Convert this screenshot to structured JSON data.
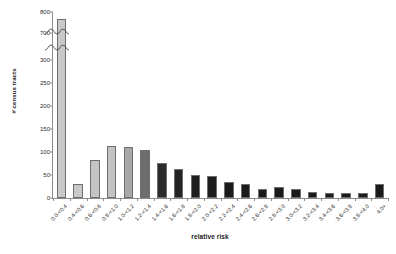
{
  "chart_data": {
    "type": "bar",
    "title": "",
    "subtitle": "",
    "xlabel": "relative risk",
    "ylabel": "# census tracts",
    "grid": false,
    "legend": null,
    "axis_break": {
      "present": true,
      "lower_range": [
        0,
        300
      ],
      "upper_range": [
        700,
        800
      ],
      "note": "y-axis broken between 300 and 700"
    },
    "ylim": [
      0,
      800
    ],
    "yticks": [
      0,
      50,
      100,
      150,
      200,
      250,
      300,
      700,
      800
    ],
    "ytick_labels": [
      "0",
      "50",
      "100",
      "150",
      "200",
      "250",
      "300",
      "700",
      "800"
    ],
    "categories": [
      "0.0-<0.4",
      "0.4-<0.6",
      "0.6-<0.8",
      "0.8-<1.0",
      "1.0-<1.2",
      "1.2-<1.4",
      "1.4-<1.6",
      "1.6-<1.8",
      "1.8-<2.0",
      "2.0-<2.2",
      "2.2-<2.4",
      "2.4-<2.6",
      "2.6-<2.8",
      "2.8-<3.0",
      "3.0-<3.2",
      "3.2-<3.4",
      "3.4-<3.6",
      "3.6-<3.8",
      "3.8-<4.0",
      "4.0+"
    ],
    "values": [
      765,
      30,
      83,
      112,
      111,
      105,
      77,
      64,
      51,
      48,
      35,
      31,
      20,
      25,
      20,
      12,
      11,
      10,
      10,
      30
    ],
    "bar_colors": [
      "#c9c9c9",
      "#c9c9c9",
      "#c4c4c4",
      "#c2c2c2",
      "#a8a8a8",
      "#6e6e6e",
      "#2a2a2a",
      "#232323",
      "#1e1e1e",
      "#1c1c1c",
      "#1a1a1a",
      "#1a1a1a",
      "#1a1a1a",
      "#1a1a1a",
      "#1a1a1a",
      "#1a1a1a",
      "#1a1a1a",
      "#1a1a1a",
      "#1a1a1a",
      "#1a1a1a"
    ],
    "axis_color": "#8c8c8c",
    "text_color": "#1a1a1a",
    "background": "#ffffff"
  }
}
